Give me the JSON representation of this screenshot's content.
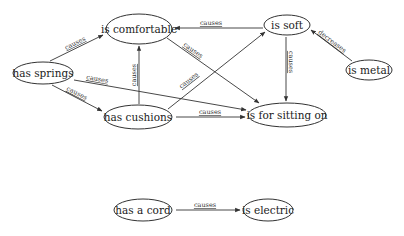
{
  "diagram": {
    "type": "causal-concept-graph",
    "nodes": [
      {
        "id": "is_comfortable",
        "label": "is comfortable",
        "cx": 139,
        "cy": 29,
        "rx": 33,
        "ry": 15
      },
      {
        "id": "is_soft",
        "label": "is soft",
        "cx": 287,
        "cy": 25,
        "rx": 23,
        "ry": 10
      },
      {
        "id": "has_springs",
        "label": "has springs",
        "cx": 43,
        "cy": 73,
        "rx": 30,
        "ry": 11
      },
      {
        "id": "is_metal",
        "label": "is metal",
        "cx": 369,
        "cy": 70,
        "rx": 23,
        "ry": 10
      },
      {
        "id": "has_cushions",
        "label": "has cushions",
        "cx": 138,
        "cy": 117,
        "rx": 34,
        "ry": 12
      },
      {
        "id": "is_for_sitting_on",
        "label": "is for sitting on",
        "cx": 287,
        "cy": 115,
        "rx": 39,
        "ry": 12
      },
      {
        "id": "has_a_cord",
        "label": "has a cord",
        "cx": 143,
        "cy": 210,
        "rx": 29,
        "ry": 11
      },
      {
        "id": "is_electric",
        "label": "is electric",
        "cx": 268,
        "cy": 210,
        "rx": 25,
        "ry": 11
      }
    ],
    "edges": [
      {
        "from": "has_springs",
        "to": "is_comfortable",
        "label": "causes",
        "x1": 50,
        "y1": 61,
        "x2": 103,
        "y2": 35,
        "lx": 76,
        "ly": 45,
        "angle": -26
      },
      {
        "from": "has_springs",
        "to": "has_cushions",
        "label": "causes",
        "x1": 52,
        "y1": 85,
        "x2": 102,
        "y2": 111,
        "lx": 76,
        "ly": 95,
        "angle": 27
      },
      {
        "from": "has_springs",
        "to": "is_for_sitting_on",
        "label": "causes",
        "x1": 74,
        "y1": 80,
        "x2": 246,
        "y2": 110,
        "lx": 97,
        "ly": 81,
        "angle": 10
      },
      {
        "from": "has_cushions",
        "to": "is_comfortable",
        "label": "causes",
        "x1": 139,
        "y1": 104,
        "x2": 139,
        "y2": 46,
        "lx": 136,
        "ly": 75,
        "angle": -90
      },
      {
        "from": "has_cushions",
        "to": "is_soft",
        "label": "causes",
        "x1": 168,
        "y1": 109,
        "x2": 265,
        "y2": 32,
        "lx": 190,
        "ly": 82,
        "angle": -38
      },
      {
        "from": "has_cushions",
        "to": "is_for_sitting_on",
        "label": "causes",
        "x1": 176,
        "y1": 117,
        "x2": 245,
        "y2": 117,
        "lx": 210,
        "ly": 114,
        "angle": 0
      },
      {
        "from": "is_soft",
        "to": "is_comfortable",
        "label": "causes",
        "x1": 263,
        "y1": 28,
        "x2": 175,
        "y2": 28,
        "lx": 211,
        "ly": 25,
        "angle": 0
      },
      {
        "from": "is_comfortable",
        "to": "is_for_sitting_on",
        "label": "causes",
        "x1": 167,
        "y1": 38,
        "x2": 259,
        "y2": 103,
        "lx": 192,
        "ly": 52,
        "angle": 35
      },
      {
        "from": "is_soft",
        "to": "is_for_sitting_on",
        "label": "causes",
        "x1": 286,
        "y1": 37,
        "x2": 286,
        "y2": 101,
        "lx": 289,
        "ly": 62,
        "angle": 90
      },
      {
        "from": "is_metal",
        "to": "is_soft",
        "label": "decreases",
        "x1": 352,
        "y1": 61,
        "x2": 311,
        "y2": 30,
        "lx": 331,
        "ly": 43,
        "angle": 37
      },
      {
        "from": "has_a_cord",
        "to": "is_electric",
        "label": "causes",
        "x1": 176,
        "y1": 210,
        "x2": 240,
        "y2": 210,
        "lx": 205,
        "ly": 207,
        "angle": 0
      }
    ]
  },
  "style": {
    "stroke_color": "#333333",
    "background": "#ffffff",
    "text_color": "#222222"
  }
}
